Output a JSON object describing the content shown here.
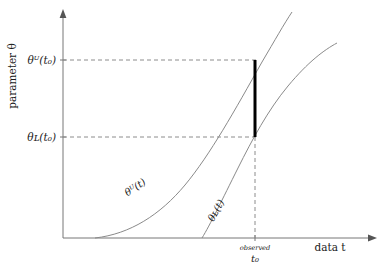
{
  "figure": {
    "axes": {
      "y_axis_label": "parameter θ",
      "x_axis_label": "data t",
      "y_ticks": [
        {
          "id": "upper",
          "label": "θᵁ(t₀)",
          "pixel_y": 60
        },
        {
          "id": "lower",
          "label": "θʟ(t₀)",
          "pixel_y": 137
        }
      ],
      "x_ticks": [
        {
          "id": "t0",
          "label_top": "observed",
          "label_bottom": "t₀",
          "pixel_x": 255
        }
      ],
      "origin": {
        "x": 63,
        "y": 238
      },
      "x_arrow_tip": {
        "x": 376,
        "y": 238
      },
      "y_arrow_tip": {
        "x": 63,
        "y": 10
      }
    },
    "curves": [
      {
        "id": "upper-bound-curve",
        "label": "θᵁ(t)",
        "label_rotation_deg": -34,
        "label_x": 137,
        "label_y": 190,
        "color": "#8a8a8a",
        "path": "M95,238 C130,234 160,215 185,185 C210,155 235,110 262,62 C275,40 284,24 292,12"
      },
      {
        "id": "lower-bound-curve",
        "label": "θʟ(t)",
        "label_rotation_deg": -62,
        "label_x": 219,
        "label_y": 212,
        "color": "#8a8a8a",
        "path": "M202,238 C210,225 222,200 238,168 C252,140 268,110 288,86 C308,62 324,50 337,43"
      }
    ],
    "guides": [
      {
        "id": "upper-horizontal-guide",
        "x1": 63,
        "y1": 60,
        "x2": 256,
        "y2": 60
      },
      {
        "id": "lower-horizontal-guide",
        "x1": 63,
        "y1": 137,
        "x2": 256,
        "y2": 137
      },
      {
        "id": "t0-vertical-guide",
        "x1": 255,
        "y1": 137,
        "x2": 255,
        "y2": 238
      }
    ],
    "interval": {
      "id": "identified-interval-bar",
      "x": 255,
      "y_top": 60,
      "y_bottom": 137,
      "color": "#000000"
    }
  }
}
